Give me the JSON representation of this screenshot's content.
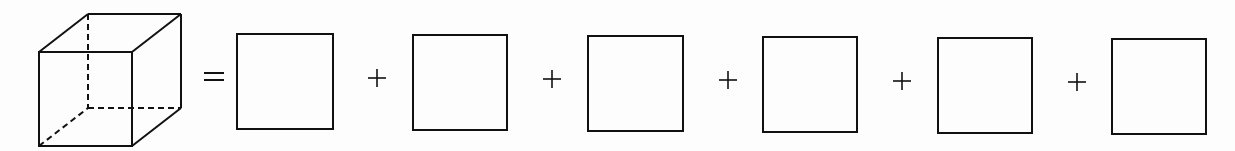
{
  "diagram": {
    "lhs": "cube",
    "equals_symbol": "=",
    "plus_symbol": "+",
    "faces_count": 6,
    "stroke_color": "#111111",
    "background_color": "#fdfdfd",
    "squares": [
      {
        "x": 237,
        "y": 34,
        "w": 96,
        "h": 95
      },
      {
        "x": 413,
        "y": 35,
        "w": 94,
        "h": 95
      },
      {
        "x": 588,
        "y": 36,
        "w": 95,
        "h": 95
      },
      {
        "x": 763,
        "y": 37,
        "w": 94,
        "h": 95
      },
      {
        "x": 938,
        "y": 38,
        "w": 94,
        "h": 95
      },
      {
        "x": 1112,
        "y": 39,
        "w": 94,
        "h": 95
      }
    ],
    "plus_positions": [
      377,
      552,
      728,
      902,
      1077
    ]
  }
}
